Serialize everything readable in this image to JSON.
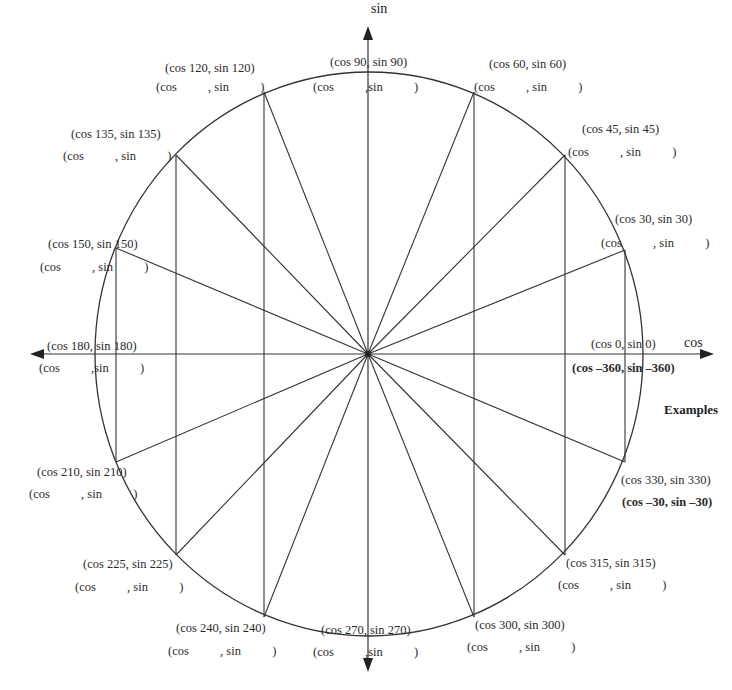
{
  "axes": {
    "x_label": "cos",
    "y_label": "sin"
  },
  "circle": {
    "cx": 369,
    "cy": 354,
    "rx": 274,
    "ry": 282
  },
  "points": [
    {
      "angle": 0,
      "x": 643,
      "y": 354,
      "label": "(cos 0,  sin 0)",
      "blank": ""
    },
    {
      "angle": 30,
      "x": 625,
      "y": 250,
      "label": "(cos 30,  sin 30)",
      "blank": "(cos          , sin          )"
    },
    {
      "angle": 45,
      "x": 565,
      "y": 155,
      "label": "(cos 45,  sin 45)",
      "blank": "(cos          , sin          )"
    },
    {
      "angle": 60,
      "x": 474,
      "y": 92,
      "label": "(cos 60,  sin 60)",
      "blank": "(cos          , sin          )"
    },
    {
      "angle": 90,
      "x": 368,
      "y": 72,
      "label": "(cos 90,  sin 90)",
      "blank": "(cos          ,sin          )"
    },
    {
      "angle": 120,
      "x": 264,
      "y": 92,
      "label": "(cos 120,  sin 120)",
      "blank": "(cos          , sin          )"
    },
    {
      "angle": 135,
      "x": 176,
      "y": 155,
      "label": "(cos 135,  sin 135)",
      "blank": "(cos          , sin          )"
    },
    {
      "angle": 150,
      "x": 116,
      "y": 248,
      "label": "(cos 150,  sin 150)",
      "blank": "(cos          , sin          )"
    },
    {
      "angle": 180,
      "x": 96,
      "y": 354,
      "label": "(cos 180,  sin 180)",
      "blank": "(cos          ,sin          )"
    },
    {
      "angle": 210,
      "x": 116,
      "y": 462,
      "label": "(cos 210,  sin 210)",
      "blank": "(cos          , sin          )"
    },
    {
      "angle": 225,
      "x": 176,
      "y": 555,
      "label": "(cos 225,  sin 225)",
      "blank": "(cos          , sin          )"
    },
    {
      "angle": 240,
      "x": 264,
      "y": 617,
      "label": "(cos 240,  sin 240)",
      "blank": "(cos          , sin          )"
    },
    {
      "angle": 270,
      "x": 368,
      "y": 637,
      "label": "(cos 270,  sin 270)",
      "blank": "(cos          ,sin          )"
    },
    {
      "angle": 300,
      "x": 474,
      "y": 617,
      "label": "(cos 300,  sin 300)",
      "blank": "(cos          , sin          )"
    },
    {
      "angle": 315,
      "x": 565,
      "y": 555,
      "label": "(cos 315,  sin 315)",
      "blank": "(cos          , sin          )"
    },
    {
      "angle": 330,
      "x": 625,
      "y": 462,
      "label": "(cos 330,  sin 330)",
      "blank": ""
    }
  ],
  "examples": {
    "title": "Examples",
    "ex_360": "(cos –360, sin –360)",
    "ex_30": "(cos –30, sin –30)"
  }
}
